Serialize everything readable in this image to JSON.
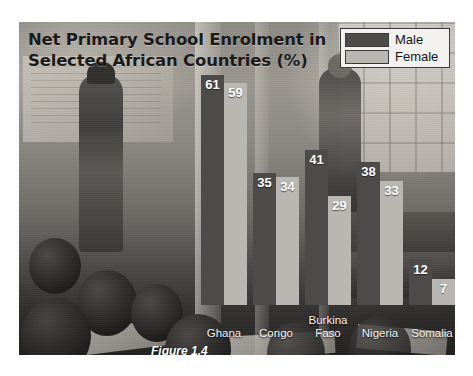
{
  "title": {
    "line1": "Net Primary School Enrolment in",
    "line2": "Selected African Countries (%)"
  },
  "caption": "Figure 1.4",
  "legend": {
    "items": [
      {
        "label": "Male",
        "color": "#4d4b4a"
      },
      {
        "label": "Female",
        "color": "#b9b7b2"
      }
    ]
  },
  "chart_data": {
    "type": "bar",
    "title": "Net Primary School Enrolment in Selected African Countries (%)",
    "xlabel": "",
    "ylabel": "",
    "ylim": [
      0,
      65
    ],
    "grid": false,
    "legend_position": "top-right",
    "categories": [
      "Ghana",
      "Congo",
      "Burkina Faso",
      "Nigeria",
      "Somalia"
    ],
    "series": [
      {
        "name": "Male",
        "color": "#4d4b4a",
        "values": [
          61,
          35,
          41,
          38,
          12
        ]
      },
      {
        "name": "Female",
        "color": "#b9b7b2",
        "values": [
          59,
          34,
          29,
          33,
          7
        ]
      }
    ]
  }
}
